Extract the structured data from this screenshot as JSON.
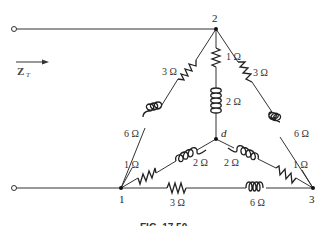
{
  "diagram": {
    "type": "circuit",
    "input_label": {
      "main": "Z",
      "subscript": "T"
    },
    "nodes": [
      {
        "id": "1",
        "label": "1"
      },
      {
        "id": "2",
        "label": "2"
      },
      {
        "id": "3",
        "label": "3"
      },
      {
        "id": "d",
        "label": "d"
      }
    ],
    "components": [
      {
        "between": "2-1",
        "type": "resistor",
        "value": "3 Ω"
      },
      {
        "between": "2-1",
        "type": "inductor",
        "value": "6 Ω"
      },
      {
        "between": "2-3",
        "type": "resistor",
        "value": "3 Ω"
      },
      {
        "between": "2-3",
        "type": "inductor",
        "value": "6 Ω"
      },
      {
        "between": "2-d",
        "type": "resistor",
        "value": "1 Ω"
      },
      {
        "between": "2-d",
        "type": "inductor",
        "value": "2 Ω"
      },
      {
        "between": "1-d",
        "type": "resistor",
        "value": "1 Ω"
      },
      {
        "between": "1-d",
        "type": "inductor",
        "value": "2 Ω"
      },
      {
        "between": "3-d",
        "type": "resistor",
        "value": "1 Ω"
      },
      {
        "between": "3-d",
        "type": "inductor",
        "value": "2 Ω"
      },
      {
        "between": "1-3",
        "type": "resistor",
        "value": "3 Ω"
      },
      {
        "between": "1-3",
        "type": "inductor",
        "value": "6 Ω"
      }
    ],
    "labels": {
      "r_21": "3 Ω",
      "l_21": "6 Ω",
      "r_23": "3 Ω",
      "l_23": "6 Ω",
      "r_2d": "1 Ω",
      "l_2d": "2 Ω",
      "r_1d": "1 Ω",
      "l_1d": "2 Ω",
      "r_3d": "1 Ω",
      "l_3d": "2 Ω",
      "r_13": "3 Ω",
      "l_13": "6 Ω"
    },
    "caption": "FIG. 17.50"
  }
}
